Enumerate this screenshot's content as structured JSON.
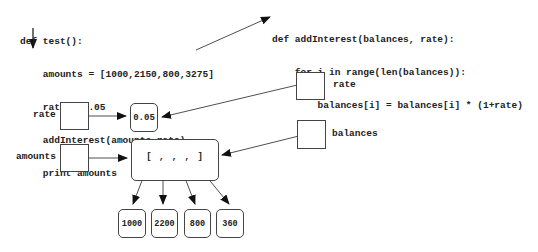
{
  "code_test": {
    "lines": [
      "def test():",
      "    amounts = [1000,2150,800,3275]",
      "    rate = 0.05",
      "    addInterest(amounts,rate)",
      "    print amounts"
    ]
  },
  "code_addInterest": {
    "lines": [
      "def addInterest(balances, rate):",
      "    for i in range(len(balances)):",
      "        balances[i] = balances[i] * (1+rate)"
    ]
  },
  "test_frame": {
    "variables": [
      {
        "name": "rate",
        "points_to": "0.05"
      },
      {
        "name": "amounts",
        "points_to": "list"
      }
    ]
  },
  "addInterest_frame": {
    "variables": [
      {
        "name": "rate",
        "points_to": "0.05"
      },
      {
        "name": "balances",
        "points_to": "list"
      }
    ]
  },
  "objects": {
    "rate_value": "0.05",
    "list_repr": "[ , , , ]",
    "list_items": [
      "1000",
      "2200",
      "800",
      "360"
    ]
  }
}
